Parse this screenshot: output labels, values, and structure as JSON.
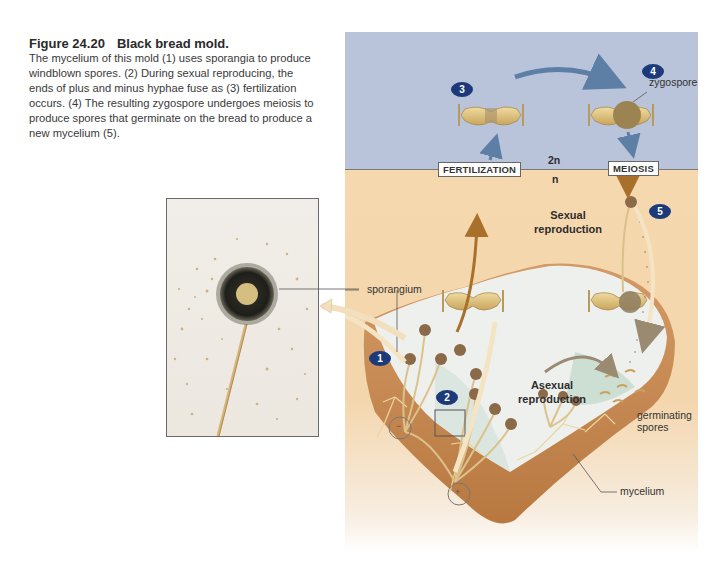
{
  "figure": {
    "number": "Figure 24.20",
    "title": "Black bread mold.",
    "caption": "The mycelium of this mold (1) uses sporangia to produce windblown spores. (2) During sexual reproducing, the ends of plus and minus hyphae fuse as (3) fertilization occurs. (4) The resulting zygospore undergoes meiosis to produce spores that germinate on the bread to produce a new mycelium (5)."
  },
  "diagram": {
    "colors": {
      "diploid_zone": "#b9c3d9",
      "haploid_zone": "#f6d8ae",
      "badge": "#1c3a7a",
      "bread_crust": "#c0834f",
      "bread_crumb": "#eef0ee",
      "arrow_blue": "#5d7fa6",
      "arrow_brown": "#a8702a"
    },
    "ploidy": {
      "diploid": "2n",
      "haploid": "n"
    },
    "boxed_labels": {
      "fertilization": "FERTILIZATION",
      "meiosis": "MEIOSIS"
    },
    "region_labels": {
      "sexual": "Sexual\nreproduction",
      "sexual_line1": "Sexual",
      "sexual_line2": "reproduction",
      "asexual_line1": "Asexual",
      "asexual_line2": "reproduction"
    },
    "callouts": {
      "zygospore": "zygospore",
      "sporangium": "sporangium",
      "germinating_line1": "germinating",
      "germinating_line2": "spores",
      "mycelium": "mycelium"
    },
    "steps": [
      "1",
      "2",
      "3",
      "4",
      "5"
    ],
    "mating_types": {
      "minus": "−",
      "plus": "+"
    }
  }
}
